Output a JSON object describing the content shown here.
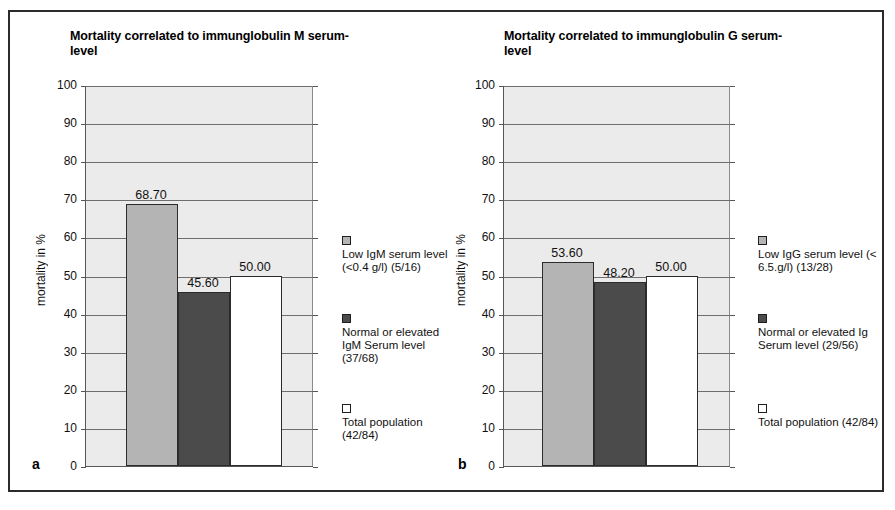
{
  "figure": {
    "panels": [
      {
        "letter": "a",
        "title": "Mortality correlated to immunglobulin M serum-level",
        "ylabel": "mortality in %",
        "chart_data": {
          "type": "bar",
          "title": "Mortality correlated to immunglobulin M serum-level",
          "xlabel": "",
          "ylabel": "mortality in %",
          "ylim": [
            0,
            100
          ],
          "ytick_labels": [
            "100",
            "90",
            "80",
            "70",
            "60",
            "50",
            "40",
            "30",
            "20",
            "10",
            "0"
          ],
          "yticks": [
            100,
            90,
            80,
            70,
            60,
            50,
            40,
            30,
            20,
            10,
            0
          ],
          "grid": true,
          "legend_position": "right",
          "categories": [
            "Low IgM serum level (<0.4 g/l) (5/16)",
            "Normal or elevated IgM Serum level (37/68)",
            "Total population (42/84)"
          ],
          "values": [
            68.7,
            45.6,
            50.0
          ],
          "value_labels": [
            "68.70",
            "45.60",
            "50.00"
          ],
          "colors": [
            "#b4b4b4",
            "#4b4b4b",
            "#ffffff"
          ]
        },
        "legend": [
          {
            "swatch": "light",
            "text": "Low IgM serum level (<0.4 g/l) (5/16)"
          },
          {
            "swatch": "dark",
            "text": "Normal or elevated IgM Serum level (37/68)"
          },
          {
            "swatch": "white",
            "text": "Total population (42/84)"
          }
        ]
      },
      {
        "letter": "b",
        "title": "Mortality correlated to immunglobulin G serum-level",
        "ylabel": "mortality in %",
        "chart_data": {
          "type": "bar",
          "title": "Mortality correlated to immunglobulin G serum-level",
          "xlabel": "",
          "ylabel": "mortality in %",
          "ylim": [
            0,
            100
          ],
          "ytick_labels": [
            "100",
            "90",
            "80",
            "70",
            "60",
            "50",
            "40",
            "30",
            "20",
            "10",
            "0"
          ],
          "yticks": [
            100,
            90,
            80,
            70,
            60,
            50,
            40,
            30,
            20,
            10,
            0
          ],
          "grid": true,
          "legend_position": "right",
          "categories": [
            "Low IgG serum level (< 6.5.g/l) (13/28)",
            "Normal or elevated Ig Serum level (29/56)",
            "Total population (42/84)"
          ],
          "values": [
            53.6,
            48.2,
            50.0
          ],
          "value_labels": [
            "53.60",
            "48.20",
            "50.00"
          ],
          "colors": [
            "#b4b4b4",
            "#4b4b4b",
            "#ffffff"
          ]
        },
        "legend": [
          {
            "swatch": "light",
            "text": "Low IgG serum level (< 6.5.g/l) (13/28)"
          },
          {
            "swatch": "dark",
            "text": "Normal or elevated Ig Serum level (29/56)"
          },
          {
            "swatch": "white",
            "text": "Total population (42/84)"
          }
        ]
      }
    ]
  }
}
